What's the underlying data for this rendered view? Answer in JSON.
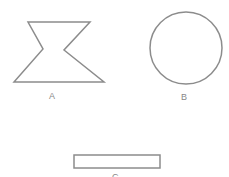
{
  "shapes": [
    {
      "label": "A",
      "type": "hourglass-polygon"
    },
    {
      "label": "B",
      "type": "circle"
    },
    {
      "label": "C",
      "type": "rectangle"
    }
  ],
  "colors": {
    "stroke": "#8c8c8c",
    "label": "#888888"
  }
}
